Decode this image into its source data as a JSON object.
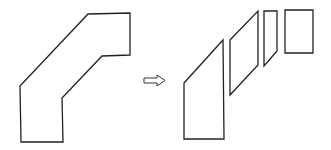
{
  "diagram": {
    "type": "decomposition",
    "stroke_color": "#222222",
    "background_color": "#ffffff",
    "original_shape": {
      "name": "bent-polygon",
      "points": "88,14 130,13 130,55 102,56 62,98 63,142 21,142 20,86"
    },
    "arrow": {
      "name": "hollow-right-arrow",
      "points": "144,78 157,78 157,75 165,80.5 157,86 157,83 144,83"
    },
    "pieces": [
      {
        "name": "piece-bottom-trapezoid",
        "points": "184,83 223,40 224,139 184,139"
      },
      {
        "name": "piece-parallelogram",
        "points": "230,40 258,11 258,65 230,95"
      },
      {
        "name": "piece-narrow-quad",
        "points": "264,11 277,11 277,51 264,66"
      },
      {
        "name": "piece-top-rectangle",
        "points": "285,10 313,10 313,53 285,53"
      }
    ]
  }
}
